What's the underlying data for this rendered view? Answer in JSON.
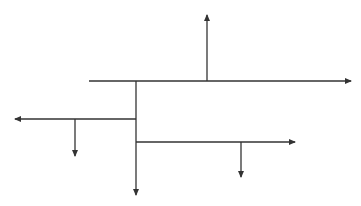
{
  "diagram": {
    "type": "branching-arrow-tree",
    "background": "#ffffff",
    "stroke_color": "#333333",
    "stroke_width": 1.3,
    "segments": [
      {
        "id": "main-horizontal",
        "x1": 89,
        "y1": 81,
        "x2": 351,
        "y2": 81,
        "arrow": "end",
        "direction": "right"
      },
      {
        "id": "up-branch",
        "x1": 207,
        "y1": 81,
        "x2": 207,
        "y2": 15,
        "arrow": "end",
        "direction": "up"
      },
      {
        "id": "vertical-trunk",
        "x1": 136,
        "y1": 81,
        "x2": 136,
        "y2": 195,
        "arrow": "end",
        "direction": "down"
      },
      {
        "id": "left-branch",
        "x1": 136,
        "y1": 119,
        "x2": 15,
        "y2": 119,
        "arrow": "end",
        "direction": "left"
      },
      {
        "id": "left-down-branch",
        "x1": 75,
        "y1": 119,
        "x2": 75,
        "y2": 156,
        "arrow": "end",
        "direction": "down"
      },
      {
        "id": "right-branch",
        "x1": 136,
        "y1": 142,
        "x2": 295,
        "y2": 142,
        "arrow": "end",
        "direction": "right"
      },
      {
        "id": "right-down-branch",
        "x1": 241,
        "y1": 142,
        "x2": 241,
        "y2": 177,
        "arrow": "end",
        "direction": "down"
      }
    ]
  }
}
